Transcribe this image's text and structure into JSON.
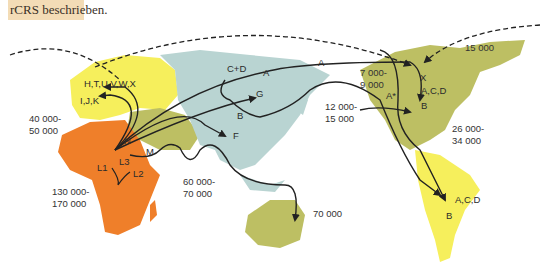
{
  "caption": {
    "text": "rCRS beschrieben."
  },
  "colors": {
    "africa": "#ef7f2a",
    "europe_and_americas_south": "#f6ef5c",
    "asia": "#b9d4d2",
    "middle_east_australia_north_america": "#bdbf63",
    "caption_background": "#f3dcb6",
    "arrow": "#222222"
  },
  "haplogroups": {
    "europe_top": "H,T,U,V,W,X",
    "europe_bottom": "I,J,K",
    "africa_n": "N",
    "africa_m": "M",
    "africa_l1": "L1",
    "africa_l2": "L2",
    "africa_l3": "L3",
    "asia_cd": "C+D",
    "asia_a": "A",
    "asia_g": "G",
    "asia_b": "B",
    "asia_f": "F",
    "pacific_a": "A",
    "na_x": "X",
    "na_astar": "A*",
    "na_acd": "A,C,D",
    "na_b": "B",
    "sa_acd": "A,C,D",
    "sa_b": "B"
  },
  "ages": {
    "europe": [
      "40 000-",
      "50 000"
    ],
    "africa": [
      "130 000-",
      "170 000"
    ],
    "south_asia": [
      "60 000-",
      "70 000"
    ],
    "australia": [
      "70 000"
    ],
    "beringia": [
      "12 000-",
      "15 000"
    ],
    "alaska": [
      "7 000-",
      "9 000"
    ],
    "greenland": [
      "15 000"
    ],
    "americas": [
      "26 000-",
      "34 000"
    ]
  }
}
